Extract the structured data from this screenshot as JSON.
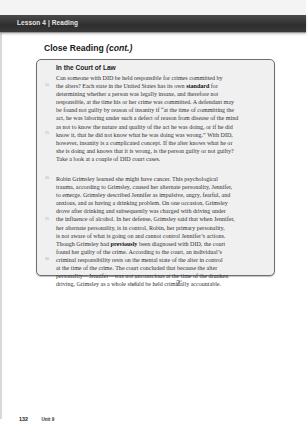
{
  "header": {
    "label": "Lesson 4 | Reading",
    "bar_color": "#3a3a3a"
  },
  "section": {
    "title": "Close Reading",
    "title_suffix": "(cont.)"
  },
  "reading_box": {
    "heading": "In the Court of Law",
    "paragraph_1": {
      "lines": [
        "Can someone with DID be held responsible for crimes committed by",
        "the alters? Each state in the United States has its own ",
        "determining whether a person was legally insane, and therefore not",
        "responsible, at the time his or her crime was committed. A defendant may",
        "be found not guilty by reason of insanity if “at the time of committing the",
        "act, he was laboring under such a defect of reason from disease of the mind",
        "as not to know the nature and quality of the act he was doing, or if he did",
        "know it, that he did not know what he was doing was wrong.” With DID,",
        "however, insanity is a complicated concept. If the alter knows what he or",
        "she is doing and knows that it is wrong, is the person guilty or not guilty?",
        "Take a look at a couple of DID court cases."
      ],
      "bold_word_line_2": "standard",
      "line_2_tail": " for"
    },
    "paragraph_2": {
      "lines": [
        "Robin Grimsley learned she might have cancer. This psychological",
        "trauma, according to Grimsley, caused her alternate personality, Jennifer,",
        "to emerge. Grimsley described Jennifer as impulsive, angry, fearful, and",
        "anxious, and as having a drinking problem. On one occasion, Grimsley",
        "drove after drinking  and subsequently was charged with driving under",
        "the influence of alcohol. In her defense, Grimsley said that when Jennifer,",
        "her alternate personality, is in control, Robin, her primary personality,",
        "is not aware of what is going on and cannot control Jennifer’s actions.",
        "Though Grimsley had ",
        "found her guilty of the crime. According to the court, an individual’s",
        "criminal responsibility rests on the mental state of the alter in control",
        "at the time of the crime. The court concluded that because the alter",
        "personality—Jennifer—was not unconscious at the time of the drunken",
        "driving, Grimsley as a whole should be held criminally accountable."
      ],
      "bold_word_line_9": "previously",
      "line_9_tail": " been diagnosed with DID, the court"
    },
    "line_numbers": [
      "10",
      "15",
      "20",
      "25",
      "30"
    ]
  },
  "annotations": {
    "check_mark": "✔",
    "question_mark": "?",
    "question_superscript": "c"
  },
  "footer": {
    "page_number": "132",
    "unit_label": "Unit 9"
  }
}
